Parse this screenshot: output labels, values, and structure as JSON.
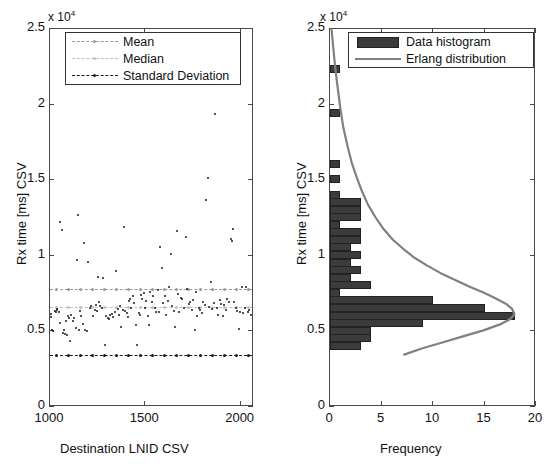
{
  "figure": {
    "panels": [
      {
        "id": "scatter",
        "axis_exponent_label": "x 10",
        "axis_exponent_sup": "4",
        "xlabel": "Destination LNID CSV",
        "ylabel": "Rx time [ms] CSV",
        "xticks": [
          "1000",
          "1500",
          "2000"
        ],
        "yticks": [
          "0",
          "0.5",
          "1",
          "1.5",
          "2",
          "2.5"
        ],
        "legend": [
          {
            "label": "Mean",
            "style": "dashed-marker",
            "color": "#9a9a9a"
          },
          {
            "label": "Median",
            "style": "dashed-marker",
            "color": "#c0c0c0"
          },
          {
            "label": "Standard Deviation",
            "style": "dashed-marker",
            "color": "#1a1a1a"
          }
        ]
      },
      {
        "id": "histogram",
        "axis_exponent_label": "x 10",
        "axis_exponent_sup": "4",
        "xlabel": "Frequency",
        "ylabel": "Rx time [ms] CSV",
        "xticks": [
          "0",
          "5",
          "10",
          "15",
          "20"
        ],
        "yticks": [
          "0",
          "0.5",
          "1",
          "1.5",
          "2",
          "2.5"
        ],
        "legend": [
          {
            "label": "Data histogram",
            "style": "patch",
            "color": "#3b3b3b"
          },
          {
            "label": "Erlang distribution",
            "style": "solid",
            "color": "#808080"
          }
        ]
      }
    ]
  },
  "chart_data": [
    {
      "type": "scatter",
      "title": "",
      "xlabel": "Destination LNID CSV",
      "ylabel": "Rx time [ms] CSV",
      "y_exponent": 10000,
      "xlim": [
        1000,
        2070
      ],
      "ylim": [
        0,
        25000
      ],
      "xticks": [
        1000,
        1500,
        2000
      ],
      "yticks": [
        0,
        5000,
        10000,
        15000,
        20000,
        25000
      ],
      "grid": false,
      "legend_position": "top-left",
      "series": [
        {
          "name": "Rx time samples",
          "marker": "dot",
          "color": "#1a1a1a",
          "points": [
            [
              1008,
              6100
            ],
            [
              1012,
              5900
            ],
            [
              1015,
              5000
            ],
            [
              1022,
              4950
            ],
            [
              1030,
              6300
            ],
            [
              1035,
              6250
            ],
            [
              1040,
              6400
            ],
            [
              1044,
              6350
            ],
            [
              1050,
              6200
            ],
            [
              1056,
              12150
            ],
            [
              1060,
              5500
            ],
            [
              1066,
              11650
            ],
            [
              1072,
              4850
            ],
            [
              1078,
              5050
            ],
            [
              1082,
              4750
            ],
            [
              1090,
              5600
            ],
            [
              1096,
              4700
            ],
            [
              1100,
              5950
            ],
            [
              1106,
              5850
            ],
            [
              1112,
              4300
            ],
            [
              1118,
              6050
            ],
            [
              1126,
              5650
            ],
            [
              1132,
              5800
            ],
            [
              1140,
              5150
            ],
            [
              1146,
              9650
            ],
            [
              1152,
              12600
            ],
            [
              1158,
              5050
            ],
            [
              1162,
              6300
            ],
            [
              1168,
              5950
            ],
            [
              1176,
              5400
            ],
            [
              1184,
              10750
            ],
            [
              1190,
              5050
            ],
            [
              1198,
              4950
            ],
            [
              1206,
              9500
            ],
            [
              1214,
              6500
            ],
            [
              1222,
              6600
            ],
            [
              1230,
              5950
            ],
            [
              1240,
              6350
            ],
            [
              1246,
              6700
            ],
            [
              1252,
              6300
            ],
            [
              1258,
              8550
            ],
            [
              1264,
              6850
            ],
            [
              1270,
              6600
            ],
            [
              1276,
              6450
            ],
            [
              1284,
              8450
            ],
            [
              1292,
              4050
            ],
            [
              1300,
              5950
            ],
            [
              1308,
              5850
            ],
            [
              1316,
              5750
            ],
            [
              1322,
              6050
            ],
            [
              1328,
              6100
            ],
            [
              1336,
              5900
            ],
            [
              1344,
              6250
            ],
            [
              1352,
              8900
            ],
            [
              1360,
              6400
            ],
            [
              1368,
              6000
            ],
            [
              1374,
              6600
            ],
            [
              1380,
              5200
            ],
            [
              1386,
              6350
            ],
            [
              1392,
              11850
            ],
            [
              1400,
              6300
            ],
            [
              1408,
              6150
            ],
            [
              1414,
              5900
            ],
            [
              1420,
              6950
            ],
            [
              1426,
              7050
            ],
            [
              1432,
              6500
            ],
            [
              1440,
              7250
            ],
            [
              1448,
              6800
            ],
            [
              1456,
              5350
            ],
            [
              1462,
              4050
            ],
            [
              1470,
              6150
            ],
            [
              1478,
              6050
            ],
            [
              1484,
              7350
            ],
            [
              1490,
              7100
            ],
            [
              1496,
              7450
            ],
            [
              1502,
              6500
            ],
            [
              1510,
              6950
            ],
            [
              1518,
              5950
            ],
            [
              1526,
              5350
            ],
            [
              1532,
              7550
            ],
            [
              1540,
              6900
            ],
            [
              1548,
              7300
            ],
            [
              1556,
              6450
            ],
            [
              1562,
              6200
            ],
            [
              1570,
              7650
            ],
            [
              1578,
              6250
            ],
            [
              1584,
              10500
            ],
            [
              1592,
              9100
            ],
            [
              1600,
              6800
            ],
            [
              1608,
              7250
            ],
            [
              1616,
              6050
            ],
            [
              1624,
              6950
            ],
            [
              1630,
              7900
            ],
            [
              1638,
              10050
            ],
            [
              1646,
              6600
            ],
            [
              1654,
              6300
            ],
            [
              1662,
              5200
            ],
            [
              1670,
              11550
            ],
            [
              1676,
              7400
            ],
            [
              1684,
              6250
            ],
            [
              1692,
              7150
            ],
            [
              1700,
              7050
            ],
            [
              1708,
              6500
            ],
            [
              1716,
              11150
            ],
            [
              1724,
              7750
            ],
            [
              1732,
              6750
            ],
            [
              1740,
              6900
            ],
            [
              1748,
              6350
            ],
            [
              1756,
              7000
            ],
            [
              1764,
              5050
            ],
            [
              1770,
              7550
            ],
            [
              1778,
              5950
            ],
            [
              1786,
              6450
            ],
            [
              1794,
              6350
            ],
            [
              1800,
              6150
            ],
            [
              1808,
              6900
            ],
            [
              1816,
              6700
            ],
            [
              1824,
              13650
            ],
            [
              1832,
              15100
            ],
            [
              1840,
              6550
            ],
            [
              1848,
              8200
            ],
            [
              1856,
              6400
            ],
            [
              1864,
              6800
            ],
            [
              1872,
              19300
            ],
            [
              1880,
              6500
            ],
            [
              1888,
              6050
            ],
            [
              1896,
              7000
            ],
            [
              1904,
              6750
            ],
            [
              1912,
              5950
            ],
            [
              1920,
              6700
            ],
            [
              1928,
              6350
            ],
            [
              1936,
              7100
            ],
            [
              1944,
              6900
            ],
            [
              1952,
              11050
            ],
            [
              1958,
              10900
            ],
            [
              1966,
              11700
            ],
            [
              1972,
              6850
            ],
            [
              1980,
              6500
            ],
            [
              1988,
              6300
            ],
            [
              1996,
              5100
            ],
            [
              2002,
              6250
            ],
            [
              2010,
              7850
            ],
            [
              2018,
              6150
            ],
            [
              2026,
              6450
            ],
            [
              2034,
              7900
            ],
            [
              2042,
              6250
            ],
            [
              2050,
              6350
            ],
            [
              2058,
              6050
            ]
          ]
        }
      ],
      "reference_lines": [
        {
          "name": "Mean",
          "y": 7750,
          "style": "dashed",
          "color": "#9a9a9a"
        },
        {
          "name": "Median",
          "y": 6550,
          "style": "dashed",
          "color": "#c0c0c0"
        },
        {
          "name": "Standard Deviation",
          "y": 3350,
          "style": "dashed",
          "color": "#1a1a1a"
        }
      ]
    },
    {
      "type": "bar",
      "orientation": "horizontal",
      "title": "",
      "xlabel": "Frequency",
      "ylabel": "Rx time [ms] CSV",
      "y_exponent": 10000,
      "xlim": [
        0,
        20
      ],
      "ylim": [
        0,
        25000
      ],
      "xticks": [
        0,
        5,
        10,
        15,
        20
      ],
      "yticks": [
        0,
        5000,
        10000,
        15000,
        20000,
        25000
      ],
      "grid": false,
      "legend_position": "top-right",
      "bin_centers": [
        4000,
        4500,
        5000,
        5500,
        6000,
        6500,
        7000,
        7500,
        8000,
        8500,
        9000,
        9500,
        10000,
        10500,
        11000,
        11500,
        12000,
        12500,
        13000,
        13500,
        14000,
        15000,
        16000,
        19400,
        22300
      ],
      "categories": [
        "4000",
        "4500",
        "5000",
        "5500",
        "6000",
        "6500",
        "7000",
        "7500",
        "8000",
        "8500",
        "9000",
        "9500",
        "10000",
        "10500",
        "11000",
        "11500",
        "12000",
        "12500",
        "13000",
        "13500",
        "14000",
        "15000",
        "16000",
        "19400",
        "22300"
      ],
      "values": [
        3,
        4,
        4,
        9,
        18,
        15,
        10,
        1,
        4,
        2,
        3,
        2,
        3,
        2,
        3,
        3,
        1,
        3,
        3,
        3,
        1,
        1,
        1,
        1,
        1
      ],
      "series": [
        {
          "name": "Data histogram",
          "color": "#3b3b3b",
          "values": [
            3,
            4,
            4,
            9,
            18,
            15,
            10,
            1,
            4,
            2,
            3,
            2,
            3,
            2,
            3,
            3,
            1,
            3,
            3,
            3,
            1,
            1,
            1,
            1,
            1
          ]
        }
      ],
      "overlay": {
        "name": "Erlang distribution",
        "color": "#808080",
        "type": "line",
        "points": [
          [
            7.3,
            3400
          ],
          [
            9.0,
            3800
          ],
          [
            11.0,
            4200
          ],
          [
            13.0,
            4600
          ],
          [
            15.0,
            5000
          ],
          [
            16.6,
            5400
          ],
          [
            17.6,
            5750
          ],
          [
            18.0,
            6050
          ],
          [
            17.8,
            6400
          ],
          [
            17.2,
            6750
          ],
          [
            16.2,
            7100
          ],
          [
            15.0,
            7500
          ],
          [
            13.6,
            7900
          ],
          [
            12.2,
            8350
          ],
          [
            10.8,
            8800
          ],
          [
            9.5,
            9300
          ],
          [
            8.3,
            9800
          ],
          [
            7.2,
            10400
          ],
          [
            6.2,
            11000
          ],
          [
            5.3,
            11700
          ],
          [
            4.5,
            12500
          ],
          [
            3.8,
            13300
          ],
          [
            3.2,
            14200
          ],
          [
            2.7,
            15100
          ],
          [
            2.2,
            16100
          ],
          [
            1.8,
            17200
          ],
          [
            1.4,
            18400
          ],
          [
            1.1,
            19700
          ],
          [
            0.85,
            21000
          ],
          [
            0.6,
            22400
          ],
          [
            0.4,
            23800
          ],
          [
            0.25,
            24900
          ]
        ]
      }
    }
  ]
}
